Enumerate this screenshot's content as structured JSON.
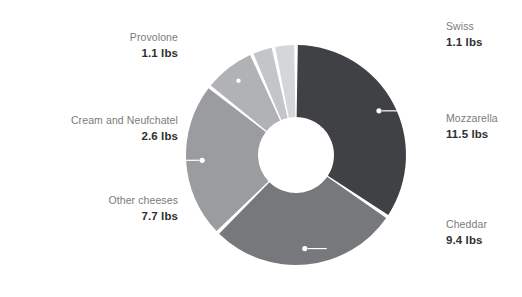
{
  "chart_data": {
    "type": "pie",
    "variant": "donut",
    "title": "",
    "subtitle": "",
    "xlabel": "",
    "ylabel": "",
    "unit": "lbs",
    "legend_position": "outside-labels",
    "grid": false,
    "total": "33.4 lbs",
    "categories": [
      "Mozzarella",
      "Cheddar",
      "Other cheeses",
      "Cream and Neufchatel",
      "Provolone",
      "Swiss"
    ],
    "values": [
      11.5,
      9.4,
      7.7,
      2.6,
      1.1,
      1.1
    ],
    "slices": [
      {
        "name": "Mozzarella",
        "value": 11.5,
        "value_label": "11.5 lbs",
        "percent": 34.4,
        "color": "#3f4145",
        "side": "right"
      },
      {
        "name": "Cheddar",
        "value": 9.4,
        "value_label": "9.4 lbs",
        "percent": 28.1,
        "color": "#76787c",
        "side": "right"
      },
      {
        "name": "Other cheeses",
        "value": 7.7,
        "value_label": "7.7 lbs",
        "percent": 23.1,
        "color": "#9a9c9f",
        "side": "left"
      },
      {
        "name": "Cream and Neufchatel",
        "value": 2.6,
        "value_label": "2.6 lbs",
        "percent": 7.8,
        "color": "#b0b2b5",
        "side": "left"
      },
      {
        "name": "Provolone",
        "value": 1.1,
        "value_label": "1.1 lbs",
        "percent": 3.3,
        "color": "#c3c5c7",
        "side": "left"
      },
      {
        "name": "Swiss",
        "value": 1.1,
        "value_label": "1.1 lbs",
        "percent": 3.3,
        "color": "#d5d6d8",
        "side": "right"
      }
    ]
  },
  "labels": {
    "provolone": {
      "name": "Provolone",
      "value": "1.1 lbs"
    },
    "cream_neufchatel": {
      "name": "Cream and Neufchatel",
      "value": "2.6 lbs"
    },
    "other_cheeses": {
      "name": "Other cheeses",
      "value": "7.7 lbs"
    },
    "swiss": {
      "name": "Swiss",
      "value": "1.1 lbs"
    },
    "mozzarella": {
      "name": "Mozzarella",
      "value": "11.5 lbs"
    },
    "cheddar": {
      "name": "Cheddar",
      "value": "9.4 lbs"
    }
  },
  "style": {
    "background": "#ffffff",
    "name_color": "#7b7b7b",
    "value_color": "#303030",
    "leader_color": "#ffffff"
  }
}
